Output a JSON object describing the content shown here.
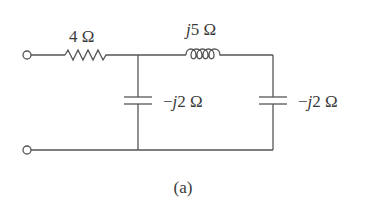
{
  "diagram": {
    "type": "circuit",
    "caption": "(a)",
    "components": {
      "resistor": {
        "label_value": "4",
        "label_unit": " Ω",
        "label": "4 Ω"
      },
      "inductor": {
        "label_j": "j",
        "label_value": "5",
        "label_unit": " Ω",
        "label": "j5 Ω"
      },
      "capacitor1": {
        "label_sign": "−",
        "label_j": "j",
        "label_value": "2",
        "label_unit": " Ω",
        "label": "−j2 Ω"
      },
      "capacitor2": {
        "label_sign": "−",
        "label_j": "j",
        "label_value": "2",
        "label_unit": " Ω",
        "label": "−j2 Ω"
      }
    },
    "terminals": [
      "top-terminal",
      "bottom-terminal"
    ],
    "colors": {
      "wire": "#555555",
      "text": "#3a3a3a",
      "background": "#ffffff"
    }
  }
}
